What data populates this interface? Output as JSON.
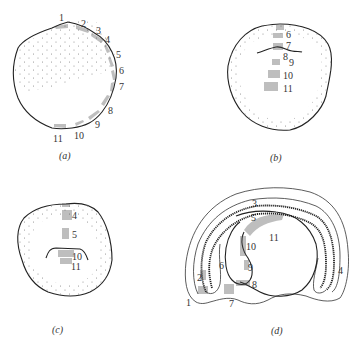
{
  "figure": {
    "panels": [
      {
        "id": "a",
        "caption": "(a)",
        "labels": [
          "1",
          "2",
          "3",
          "4",
          "5",
          "6",
          "7",
          "8",
          "9",
          "10",
          "11"
        ]
      },
      {
        "id": "b",
        "caption": "(b)",
        "labels": [
          "6",
          "7",
          "8",
          "9",
          "10",
          "11"
        ]
      },
      {
        "id": "c",
        "caption": "(c)",
        "labels": [
          "4",
          "5",
          "10",
          "11"
        ]
      },
      {
        "id": "d",
        "caption": "(d)",
        "labels": [
          "1",
          "2",
          "3",
          "4",
          "5",
          "6",
          "7",
          "8",
          "9",
          "10",
          "11"
        ]
      }
    ]
  },
  "colors": {
    "line": "#222222",
    "hatch": "#555555",
    "stipple": "#888888",
    "background": "#ffffff"
  }
}
